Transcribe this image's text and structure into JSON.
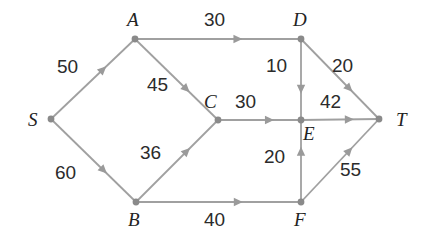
{
  "figure": {
    "type": "directed-weighted-graph",
    "background_color": "#ffffff",
    "edge_color": "#a0a0a0",
    "node_color": "#8a8a8a",
    "label_color": "#232323"
  },
  "nodes": [
    {
      "id": "S",
      "label": "S",
      "x": 51,
      "y": 119,
      "label_x": 28,
      "label_y": 110
    },
    {
      "id": "A",
      "label": "A",
      "x": 135,
      "y": 39,
      "label_x": 127,
      "label_y": 10
    },
    {
      "id": "B",
      "label": "B",
      "x": 136,
      "y": 202,
      "label_x": 128,
      "label_y": 210
    },
    {
      "id": "C",
      "label": "C",
      "x": 218,
      "y": 120,
      "label_x": 204,
      "label_y": 92
    },
    {
      "id": "D",
      "label": "D",
      "x": 301,
      "y": 39,
      "label_x": 293,
      "label_y": 10
    },
    {
      "id": "E",
      "label": "E",
      "x": 301,
      "y": 120,
      "label_x": 303,
      "label_y": 124
    },
    {
      "id": "F",
      "label": "F",
      "x": 301,
      "y": 202,
      "label_x": 294,
      "label_y": 210
    },
    {
      "id": "T",
      "label": "T",
      "x": 379,
      "y": 119,
      "label_x": 396,
      "label_y": 110
    }
  ],
  "edges": [
    {
      "from": "S",
      "to": "A",
      "weight": "50",
      "weight_x": 57,
      "weight_y": 57
    },
    {
      "from": "S",
      "to": "B",
      "weight": "60",
      "weight_x": 55,
      "weight_y": 163
    },
    {
      "from": "A",
      "to": "D",
      "weight": "30",
      "weight_x": 204,
      "weight_y": 10
    },
    {
      "from": "A",
      "to": "C",
      "weight": "45",
      "weight_x": 147,
      "weight_y": 75
    },
    {
      "from": "B",
      "to": "C",
      "weight": "36",
      "weight_x": 140,
      "weight_y": 143
    },
    {
      "from": "B",
      "to": "F",
      "weight": "40",
      "weight_x": 204,
      "weight_y": 210
    },
    {
      "from": "C",
      "to": "E",
      "weight": "30",
      "weight_x": 235,
      "weight_y": 92
    },
    {
      "from": "D",
      "to": "E",
      "weight": "10",
      "weight_x": 266,
      "weight_y": 56
    },
    {
      "from": "D",
      "to": "T",
      "weight": "20",
      "weight_x": 332,
      "weight_y": 56
    },
    {
      "from": "E",
      "to": "T",
      "weight": "42",
      "weight_x": 320,
      "weight_y": 92
    },
    {
      "from": "F",
      "to": "E",
      "weight": "20",
      "weight_x": 264,
      "weight_y": 147
    },
    {
      "from": "F",
      "to": "T",
      "weight": "55",
      "weight_x": 340,
      "weight_y": 160
    }
  ]
}
